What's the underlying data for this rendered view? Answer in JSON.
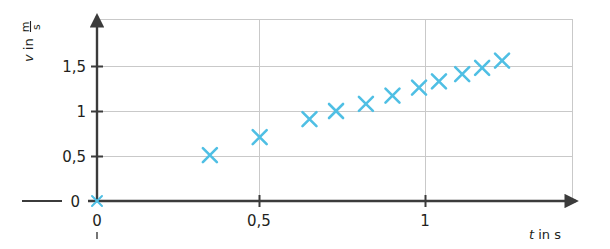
{
  "chart_data": {
    "type": "scatter",
    "title": "",
    "xlabel": "t in s",
    "ylabel": "v in m/s",
    "xlabel_symbol": "t",
    "xlabel_rest": "in s",
    "ylabel_symbol": "v",
    "ylabel_rest": "in",
    "ylabel_frac_num": "m",
    "ylabel_frac_den": "s",
    "xlim": [
      0,
      1.44
    ],
    "ylim": [
      0,
      1.9
    ],
    "xticks": [
      0,
      0.5,
      1
    ],
    "xtick_labels": [
      "0",
      "0,5",
      "1"
    ],
    "yticks": [
      0,
      0.5,
      1,
      1.5
    ],
    "ytick_labels": [
      "0",
      "0,5",
      "1",
      "1,5"
    ],
    "grid": true,
    "grid_color": "#c9c9c9",
    "axis_color": "#3b3b3b",
    "marker": "x",
    "marker_color": "#4fbfe4",
    "legend": "none",
    "series": [
      {
        "name": "measurement",
        "x": [
          0,
          0.34,
          0.49,
          0.64,
          0.72,
          0.81,
          0.89,
          0.97,
          1.03,
          1.1,
          1.16,
          1.22
        ],
        "y": [
          0,
          0.51,
          0.71,
          0.91,
          1.0,
          1.08,
          1.17,
          1.26,
          1.33,
          1.41,
          1.48,
          1.56
        ]
      }
    ]
  },
  "axes": {
    "x_tick_0": "0",
    "x_tick_1": "0,5",
    "x_tick_2": "1",
    "y_tick_0": "0",
    "y_tick_1": "0,5",
    "y_tick_2": "1",
    "y_tick_3": "1,5",
    "origin_label_x": "0",
    "origin_label_y": "0"
  }
}
